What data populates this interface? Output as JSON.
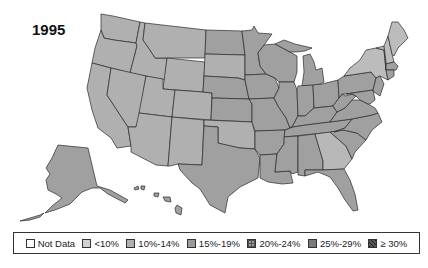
{
  "title": "1995",
  "legend": {
    "items": [
      {
        "label": "Not Data",
        "color": "#ffffff",
        "pattern": "none"
      },
      {
        "label": "<10%",
        "color": "#d2d2d2",
        "pattern": "none"
      },
      {
        "label": "10%-14%",
        "color": "#b0b0b0",
        "pattern": "none"
      },
      {
        "label": "15%-19%",
        "color": "#9a9a9a",
        "pattern": "none"
      },
      {
        "label": "20%-24%",
        "color": "#8c8c8c",
        "pattern": "grid"
      },
      {
        "label": "25%-29%",
        "color": "#7a7a7a",
        "pattern": "none"
      },
      {
        "label": "≥ 30%",
        "color": "#4a4a4a",
        "pattern": "diagonal"
      }
    ]
  },
  "colors": {
    "c10_14": "#b4b4b4",
    "c15_19": "#a0a0a0",
    "border": "#2a2a2a"
  }
}
